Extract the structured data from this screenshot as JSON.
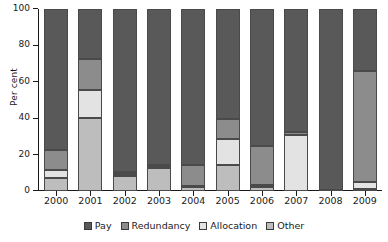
{
  "chart_data": {
    "type": "bar",
    "subtype": "stacked-bar-100-percent",
    "title": "",
    "xlabel": "",
    "ylabel": "Per cent",
    "ylim": [
      0,
      100
    ],
    "yticks": [
      0,
      20,
      40,
      60,
      80,
      100
    ],
    "ytick_labels": [
      "0",
      "20",
      "40",
      "60",
      "80",
      "100"
    ],
    "grid": false,
    "legend_position": "bottom",
    "categories": [
      "2000",
      "2001",
      "2002",
      "2003",
      "2004",
      "2005",
      "2006",
      "2007",
      "2008",
      "2009"
    ],
    "series": [
      {
        "name": "Pay",
        "color": "#595959",
        "values": [
          77.5,
          27.5,
          89.5,
          85.5,
          85.5,
          60.5,
          75.0,
          67.5,
          99.5,
          34.0
        ]
      },
      {
        "name": "Redundancy",
        "color": "#8c8c8c",
        "values": [
          11.0,
          17.0,
          1.0,
          1.0,
          12.0,
          11.0,
          21.5,
          1.5,
          0.0,
          61.0
        ]
      },
      {
        "name": "Allocation",
        "color": "#e3e3e3",
        "values": [
          4.5,
          15.5,
          1.0,
          1.0,
          0.5,
          14.0,
          1.5,
          31.0,
          0.0,
          4.0
        ]
      },
      {
        "name": "Other",
        "color": "#bdbdbd",
        "values": [
          7.0,
          40.0,
          8.5,
          12.5,
          2.0,
          14.5,
          2.0,
          0.0,
          0.5,
          1.0
        ]
      }
    ]
  },
  "legend": {
    "items": [
      {
        "label": "Pay",
        "color": "#595959"
      },
      {
        "label": "Redundancy",
        "color": "#8c8c8c"
      },
      {
        "label": "Allocation",
        "color": "#e3e3e3"
      },
      {
        "label": "Other",
        "color": "#bdbdbd"
      }
    ]
  },
  "axes": {
    "y_title": "Per cent"
  }
}
